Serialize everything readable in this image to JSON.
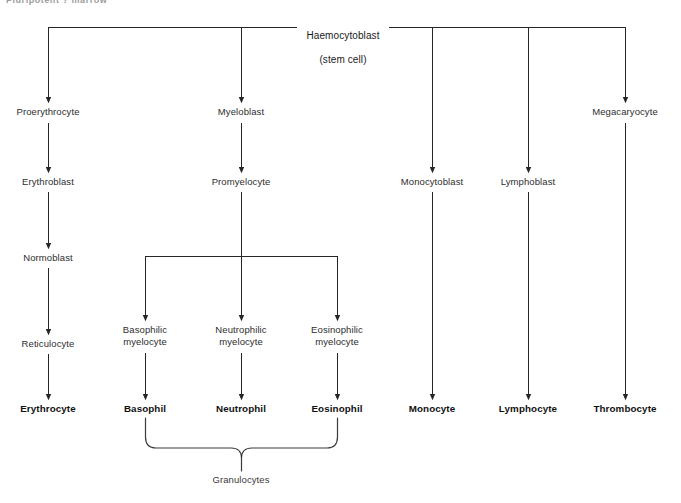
{
  "page": {
    "clipped_header_text": "Pluripotent   ?   marrow",
    "background_color": "#ffffff",
    "line_color": "#262626",
    "text_color": "#2e2e2e"
  },
  "diagram": {
    "type": "flowchart",
    "root": {
      "line1": "Haemocytoblast",
      "line2": "(stem cell)"
    },
    "branches": [
      {
        "name": "erythroid",
        "steps": [
          "Proerythrocyte",
          "Erythroblast",
          "Normoblast",
          "Reticulocyte"
        ],
        "terminal": "Erythrocyte"
      },
      {
        "name": "granulocytic",
        "steps": [
          "Myeloblast",
          "Promyelocyte"
        ],
        "sub_branches": [
          {
            "precursor_line1": "Basophilic",
            "precursor_line2": "myelocyte",
            "terminal": "Basophil"
          },
          {
            "precursor_line1": "Neutrophilic",
            "precursor_line2": "myelocyte",
            "terminal": "Neutrophil"
          },
          {
            "precursor_line1": "Eosinophilic",
            "precursor_line2": "myelocyte",
            "terminal": "Eosinophil"
          }
        ],
        "group_label": "Granulocytes"
      },
      {
        "name": "monocytic",
        "steps": [
          "Monocytoblast"
        ],
        "terminal": "Monocyte"
      },
      {
        "name": "lymphoid",
        "steps": [
          "Lymphoblast"
        ],
        "terminal": "Lymphocyte"
      },
      {
        "name": "megakaryocytic",
        "steps": [
          "Megacaryocyte"
        ],
        "terminal": "Thrombocyte"
      }
    ],
    "labels": {
      "root_line1": "Haemocytoblast",
      "root_line2": "(stem cell)",
      "proerythrocyte": "Proerythrocyte",
      "erythroblast": "Erythroblast",
      "normoblast": "Normoblast",
      "reticulocyte": "Reticulocyte",
      "erythrocyte": "Erythrocyte",
      "myeloblast": "Myeloblast",
      "promyelocyte": "Promyelocyte",
      "basophilic_myelocyte": "Basophilic\nmyelocyte",
      "neutrophilic_myelocyte": "Neutrophilic\nmyelocyte",
      "eosinophilic_myelocyte": "Eosinophilic\nmyelocyte",
      "basophil": "Basophil",
      "neutrophil": "Neutrophil",
      "eosinophil": "Eosinophil",
      "granulocytes": "Granulocytes",
      "monocytoblast": "Monocytoblast",
      "monocyte": "Monocyte",
      "lymphoblast": "Lymphoblast",
      "lymphocyte": "Lymphocyte",
      "megacaryocyte": "Megacaryocyte",
      "thrombocyte": "Thrombocyte"
    }
  }
}
